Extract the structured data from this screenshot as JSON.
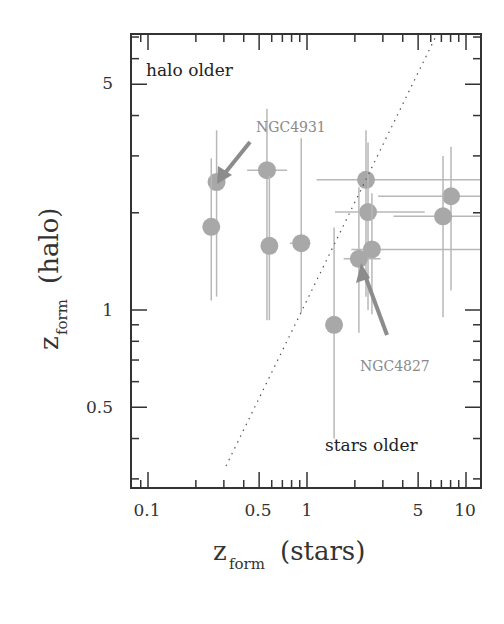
{
  "chart_data": {
    "type": "scatter",
    "title": "",
    "xlabel": "z_form (stars)",
    "ylabel": "z_form (halo)",
    "xscale": "log",
    "yscale": "log",
    "xlim": [
      0.085,
      13
    ],
    "ylim": [
      0.33,
      7.2
    ],
    "grid": false,
    "x_ticks": [
      0.1,
      0.5,
      1,
      5,
      10
    ],
    "x_tick_labels": [
      "0.1",
      "0.5",
      "1",
      "5",
      "10"
    ],
    "y_ticks": [
      0.5,
      1,
      5
    ],
    "y_tick_labels": [
      "0.5",
      "1",
      "5"
    ],
    "reference_line": {
      "style": "dotted",
      "description": "1:1 line (z_halo = z_stars)"
    },
    "region_labels": [
      {
        "text": "halo older",
        "position": "top-left"
      },
      {
        "text": "stars older",
        "position": "bottom-right"
      }
    ],
    "points": [
      {
        "x": 0.27,
        "y": 2.49,
        "xerr": [
          0.27,
          0.27
        ],
        "yerr": [
          1.1,
          3.6
        ],
        "label": "NGC4931"
      },
      {
        "x": 0.25,
        "y": 1.81,
        "xerr": [
          0.25,
          0.25
        ],
        "yerr": [
          1.07,
          2.95
        ],
        "label": ""
      },
      {
        "x": 0.56,
        "y": 2.71,
        "xerr": [
          0.42,
          0.75
        ],
        "yerr": [
          0.93,
          4.2
        ],
        "label": ""
      },
      {
        "x": 0.58,
        "y": 1.58,
        "xerr": [
          0.58,
          0.58
        ],
        "yerr": [
          0.93,
          2.6
        ],
        "label": ""
      },
      {
        "x": 0.92,
        "y": 1.61,
        "xerr": [
          0.78,
          1.05
        ],
        "yerr": [
          0.98,
          3.4
        ],
        "label": ""
      },
      {
        "x": 1.48,
        "y": 0.9,
        "xerr": [
          1.48,
          1.48
        ],
        "yerr": [
          0.4,
          1.8
        ],
        "label": ""
      },
      {
        "x": 2.35,
        "y": 2.53,
        "xerr": [
          1.15,
          13
        ],
        "yerr": [
          1.1,
          3.6
        ],
        "label": ""
      },
      {
        "x": 2.42,
        "y": 2.01,
        "xerr": [
          1.5,
          5.5
        ],
        "yerr": [
          1.0,
          3.3
        ],
        "label": ""
      },
      {
        "x": 2.56,
        "y": 1.54,
        "xerr": [
          1.9,
          13
        ],
        "yerr": [
          0.97,
          2.3
        ],
        "label": ""
      },
      {
        "x": 2.12,
        "y": 1.44,
        "xerr": [
          1.7,
          2.9
        ],
        "yerr": [
          0.85,
          2.4
        ],
        "label": "NGC4827"
      },
      {
        "x": 8.05,
        "y": 2.25,
        "xerr": [
          2.8,
          13
        ],
        "yerr": [
          1.15,
          3.2
        ],
        "label": ""
      },
      {
        "x": 7.17,
        "y": 1.95,
        "xerr": [
          3.5,
          13
        ],
        "yerr": [
          0.95,
          3.0
        ],
        "label": ""
      }
    ],
    "annotations": [
      {
        "text": "NGC4931",
        "arrow_to": "point (0.27, 2.49)"
      },
      {
        "text": "NGC4827",
        "arrow_to": "point (2.12, 1.44)"
      }
    ]
  },
  "labels": {
    "halo_older": "halo older",
    "stars_older": "stars older",
    "ngc4931": "NGC4931",
    "ngc4827": "NGC4827",
    "x_axis_main": "z",
    "x_axis_sub": "form",
    "x_axis_rest": "(stars)",
    "y_axis_main": "z",
    "y_axis_sub": "form",
    "y_axis_rest": "(halo)",
    "xtick_0": "0.1",
    "xtick_1": "0.5",
    "xtick_2": "1",
    "xtick_3": "5",
    "xtick_4": "10",
    "ytick_0": "5",
    "ytick_1": "1",
    "ytick_2": "0.5"
  },
  "colors": {
    "marker": "#a8a8a8",
    "errorbar": "#b8b8b8",
    "arrow": "#8c8c8c",
    "axis": "#333333"
  }
}
